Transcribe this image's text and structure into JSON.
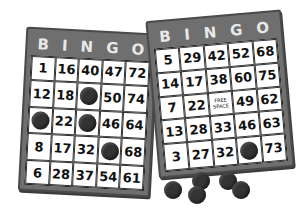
{
  "header_letters": [
    "B",
    "I",
    "N",
    "G",
    "O"
  ],
  "colors": {
    "card_frame": "#6f6f6f",
    "header_text": "#e8e8e8",
    "chip": "#333333",
    "cell_bg": "#ffffff"
  },
  "left_card": {
    "rows": [
      [
        "1",
        "16",
        "40",
        "47",
        "72"
      ],
      [
        "12",
        "18",
        "chip",
        "50",
        "74"
      ],
      [
        "chip",
        "22",
        "chip",
        "46",
        "64"
      ],
      [
        "8",
        "17",
        "32",
        "chip",
        "68"
      ],
      [
        "6",
        "28",
        "37",
        "54",
        "61"
      ]
    ]
  },
  "right_card": {
    "rows": [
      [
        "5",
        "29",
        "42",
        "52",
        "68"
      ],
      [
        "14",
        "17",
        "38",
        "60",
        "75"
      ],
      [
        "7",
        "22",
        "FREE SPACE",
        "49",
        "62"
      ],
      [
        "13",
        "28",
        "33",
        "46",
        "63"
      ],
      [
        "3",
        "27",
        "32",
        "chip",
        "73"
      ]
    ]
  },
  "loose_chips": [
    {
      "x": 164,
      "y": 181
    },
    {
      "x": 192,
      "y": 172
    },
    {
      "x": 188,
      "y": 186
    },
    {
      "x": 219,
      "y": 172
    },
    {
      "x": 232,
      "y": 181
    }
  ]
}
